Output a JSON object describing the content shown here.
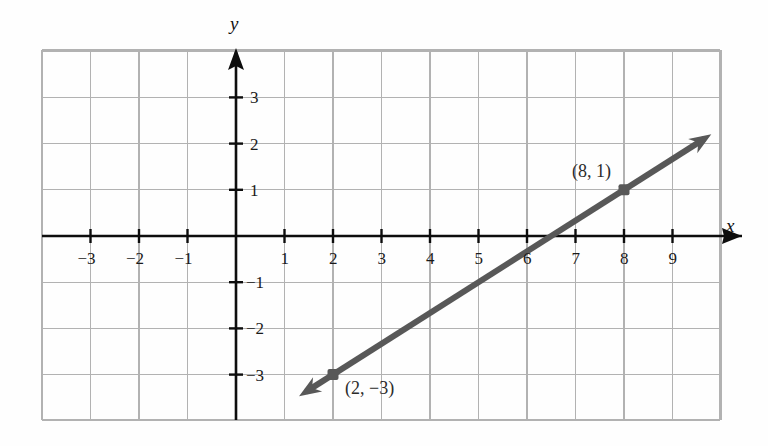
{
  "chart_data": {
    "type": "line",
    "title": "",
    "xlabel": "x",
    "ylabel": "y",
    "grid": true,
    "legend": "none",
    "xlim": [
      -4,
      10
    ],
    "ylim": [
      -4,
      4
    ],
    "x_ticks": [
      -3,
      -2,
      -1,
      1,
      2,
      3,
      4,
      5,
      6,
      7,
      8,
      9
    ],
    "y_ticks": [
      3,
      2,
      1,
      -1,
      -2,
      -3
    ],
    "x_tick_labels": [
      "−3",
      "−2",
      "−1",
      "1",
      "2",
      "3",
      "4",
      "5",
      "6",
      "7",
      "8",
      "9"
    ],
    "y_tick_labels": [
      "3",
      "2",
      "1",
      "−1",
      "−2",
      "−3"
    ],
    "series": [
      {
        "name": "line-through-two-points",
        "kind": "line",
        "slope": 0.6666666667,
        "intercept": -4.3333333333,
        "equation": "y = (2/3)x - 13/3",
        "color": "#585858",
        "arrows": "both",
        "x": [
          1.3,
          9.8
        ],
        "y": [
          -3.46,
          2.2
        ],
        "points": [
          {
            "x": 2,
            "y": -3,
            "label": "(2, −3)",
            "label_position": "right-below"
          },
          {
            "x": 8,
            "y": 1,
            "label": "(8, 1)",
            "label_position": "above-left"
          }
        ]
      }
    ],
    "annotations": [
      {
        "text": "(2, −3)",
        "x": 2,
        "y": -3
      },
      {
        "text": "(8, 1)",
        "x": 8,
        "y": 1
      }
    ],
    "colors": {
      "line": "#585858",
      "grid": "#b2b2b2",
      "axis": "#0d0d0d",
      "point": "#585858",
      "background": "#ffffff"
    }
  },
  "axes": {
    "x_name": "x",
    "y_name": "y"
  }
}
